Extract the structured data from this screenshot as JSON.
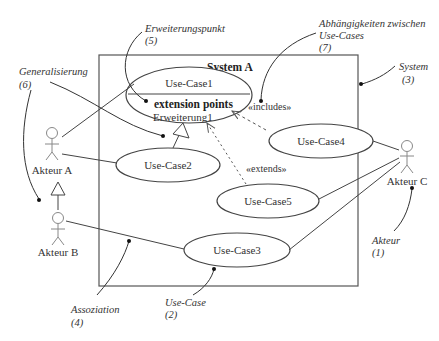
{
  "system": {
    "title": "System A"
  },
  "use_cases": [
    {
      "id": "uc1",
      "label": "Use-Case1"
    },
    {
      "id": "uc2",
      "label": "Use-Case2"
    },
    {
      "id": "uc3",
      "label": "Use-Case3"
    },
    {
      "id": "uc4",
      "label": "Use-Case4"
    },
    {
      "id": "uc5",
      "label": "Use-Case5"
    }
  ],
  "extension": {
    "header": "extension points",
    "point": "Erweiterung1"
  },
  "actors": [
    {
      "id": "a",
      "label": "Akteur A"
    },
    {
      "id": "b",
      "label": "Akteur B"
    },
    {
      "id": "c",
      "label": "Akteur C"
    }
  ],
  "stereotypes": {
    "includes": "«includes»",
    "extends": "«extends»"
  },
  "annotations": {
    "erweiterungspunkt": {
      "title": "Erweiterungspunkt",
      "num": "(5)"
    },
    "abhaengigkeiten": {
      "line1": "Abhängigkeiten zwischen",
      "line2": "Use-Cases",
      "num": "(7)"
    },
    "system": {
      "title": "System",
      "num": "(3)"
    },
    "generalisierung": {
      "title": "Generalisierung",
      "num": "(6)"
    },
    "akteur": {
      "title": "Akteur",
      "num": "(1)"
    },
    "assoziation": {
      "title": "Assoziation",
      "num": "(4)"
    },
    "use_case": {
      "title": "Use-Case",
      "num": "(2)"
    }
  },
  "colors": {
    "line": "#444444",
    "text": "#333333",
    "actor": "#888888"
  }
}
